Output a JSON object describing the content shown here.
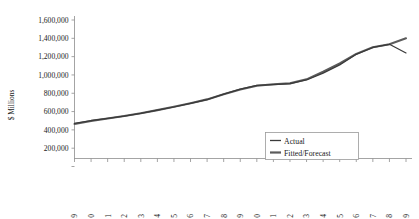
{
  "chart_data": {
    "type": "line",
    "title": "",
    "xlabel": "",
    "ylabel": "$ Millions",
    "ylim": [
      0,
      1600000
    ],
    "ytick_labels": [
      "1,600,000",
      "1,400,000",
      "1,200,000",
      "1,000,000",
      "800,000",
      "600,000",
      "400,000",
      "200,000"
    ],
    "ytick_values": [
      1600000,
      1400000,
      1200000,
      1000000,
      800000,
      600000,
      400000,
      200000
    ],
    "grid": false,
    "legend_position": "bottom-right",
    "categories": [
      "1989",
      "1990",
      "1991",
      "1992",
      "1993",
      "1994",
      "1995",
      "1996",
      "1997",
      "1998",
      "1999",
      "2000",
      "2001",
      "2002",
      "2003",
      "2004",
      "2005",
      "2006",
      "2007",
      "2008",
      "2009"
    ],
    "series": [
      {
        "name": "Actual",
        "values": [
          470000,
          500000,
          525000,
          550000,
          580000,
          615000,
          650000,
          690000,
          730000,
          790000,
          845000,
          885000,
          895000,
          905000,
          945000,
          1020000,
          1110000,
          1225000,
          1300000,
          1335000,
          1240000
        ]
      },
      {
        "name": "Fitted/Forecast",
        "values": [
          465000,
          498000,
          524000,
          551000,
          582000,
          616000,
          652000,
          691000,
          733000,
          788000,
          842000,
          882000,
          898000,
          908000,
          952000,
          1035000,
          1125000,
          1230000,
          1302000,
          1335000,
          1400000
        ]
      }
    ]
  },
  "legend": {
    "items": [
      {
        "label": "Actual"
      },
      {
        "label": "Fitted/Forecast"
      }
    ]
  }
}
